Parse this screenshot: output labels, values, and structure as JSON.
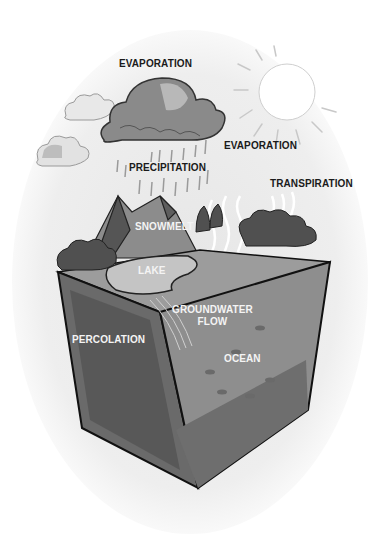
{
  "diagram": {
    "labels": {
      "evaporation_top": "EVAPORATION",
      "evaporation_right": "EVAPORATION",
      "precipitation": "PRECIPITATION",
      "transpiration": "TRANSPIRATION",
      "snowmelt": "SNOWMELT",
      "lake": "LAKE",
      "groundwater_line1": "GROUNDWATER",
      "groundwater_line2": "FLOW",
      "percolation": "PERCOLATION",
      "ocean": "OCEAN"
    },
    "colors": {
      "background_oval": "#eeeeee",
      "cloud_dark": "#7a7a7a",
      "cloud_light": "#c8c8c8",
      "sun": "#ffffff",
      "soil_dark": "#5a5a5a",
      "soil_mid": "#7d7d7d",
      "ocean": "#9a9a9a",
      "trees": "#4a4a4a",
      "outline": "#111111"
    }
  }
}
